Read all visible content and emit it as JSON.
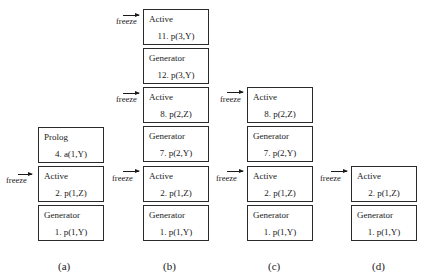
{
  "freeze_label": "freeze",
  "columns": [
    {
      "caption": "(a)",
      "boxes": [
        {
          "label": "Prolog",
          "goal": "4. a(1,Y)"
        },
        {
          "label": "Active",
          "goal": "2. p(1,Z)"
        },
        {
          "label": "Generator",
          "goal": "1. p(1,Y)"
        }
      ]
    },
    {
      "caption": "(b)",
      "boxes": [
        {
          "label": "Active",
          "goal": "11. p(3,Y)"
        },
        {
          "label": "Generator",
          "goal": "12. p(3,Y)"
        },
        {
          "label": "Active",
          "goal": "8. p(2,Z)"
        },
        {
          "label": "Generator",
          "goal": "7. p(2,Y)"
        },
        {
          "label": "Active",
          "goal": "2. p(1,Z)"
        },
        {
          "label": "Generator",
          "goal": "1. p(1,Y)"
        }
      ]
    },
    {
      "caption": "(c)",
      "boxes": [
        {
          "label": "Active",
          "goal": "8. p(2,Z)"
        },
        {
          "label": "Generator",
          "goal": "7. p(2,Y)"
        },
        {
          "label": "Active",
          "goal": "2. p(1,Z)"
        },
        {
          "label": "Generator",
          "goal": "1. p(1,Y)"
        }
      ]
    },
    {
      "caption": "(d)",
      "boxes": [
        {
          "label": "Active",
          "goal": "2. p(1,Z)"
        },
        {
          "label": "Generator",
          "goal": "1. p(1,Y)"
        }
      ]
    }
  ]
}
